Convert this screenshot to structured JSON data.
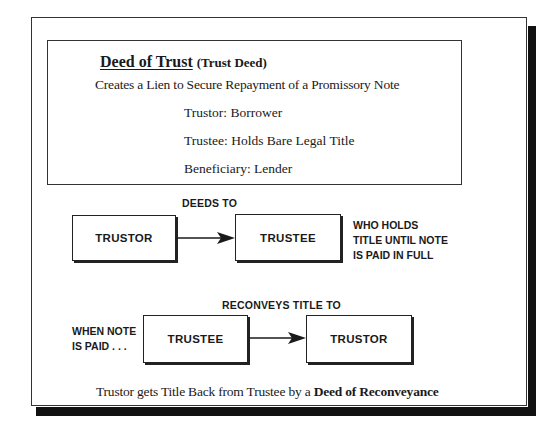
{
  "header": {
    "title": "Deed of Trust",
    "title_parenthetical": "(Trust Deed)",
    "subtitle": "Creates a Lien to Secure Repayment of a Promissory Note"
  },
  "roles": [
    {
      "text": "Trustor:  Borrower"
    },
    {
      "text": "Trustee:  Holds Bare Legal Title"
    },
    {
      "text": "Beneficiary:  Lender"
    }
  ],
  "diagram": {
    "row1": {
      "edge_label": "DEEDS TO",
      "from_box": "TRUSTOR",
      "to_box": "TRUSTEE",
      "note_lines": [
        "WHO HOLDS",
        "TITLE UNTIL NOTE",
        "IS PAID IN FULL"
      ]
    },
    "row2": {
      "edge_label": "RECONVEYS TITLE TO",
      "from_box": "TRUSTEE",
      "to_box": "TRUSTOR",
      "note_lines": [
        "WHEN NOTE",
        "IS PAID . . ."
      ]
    }
  },
  "footer": {
    "text_plain": "Trustor gets Title Back from Trustee by a",
    "text_bold": "Deed of Reconveyance"
  },
  "colors": {
    "background": "#ffffff",
    "ink": "#1a1a1a",
    "shadow": "#111111"
  }
}
